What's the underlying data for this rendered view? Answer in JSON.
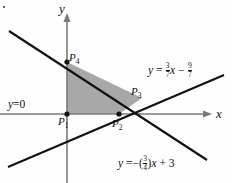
{
  "figure": {
    "type": "coordinate-plane-diagram",
    "width": 232,
    "height": 183,
    "colors": {
      "shade_fill": "#a8a8a8",
      "line": "#111111",
      "axis": "#7a7a7a",
      "background": "#fefefe",
      "text": "#111111"
    }
  },
  "axes": {
    "x_label": "x",
    "y_label": "y",
    "origin_px": [
      67,
      114
    ],
    "x_axis_y_px": 114,
    "y_axis_x_px": 67
  },
  "lines": [
    {
      "name": "x-axis-constraint",
      "label": "y = 0",
      "label_lhs": "y",
      "label_op": "=",
      "label_rhs": "0",
      "slope": 0,
      "intercept": 0
    },
    {
      "name": "descending-line",
      "label": "y = -(3/4)x + 3",
      "lhs": "y",
      "eq": "=",
      "sign": "−(",
      "frac_num": "3",
      "frac_den": "4",
      "close_paren": ")",
      "var": "x",
      "plus": "+",
      "constant": "3",
      "slope": -0.75,
      "intercept": 3
    },
    {
      "name": "ascending-line",
      "label": "y = (3/7)x - 9/7",
      "lhs": "y",
      "eq": "=",
      "frac1_num": "3",
      "frac1_den": "7",
      "var": "x",
      "minus": "−",
      "frac2_num": "9",
      "frac2_den": "7",
      "slope": 0.4286,
      "intercept": -1.2857
    }
  ],
  "points": [
    {
      "id": "P1",
      "letter": "P",
      "sub": "1",
      "role": "origin-vertex",
      "px": [
        67,
        114
      ]
    },
    {
      "id": "P2",
      "letter": "P",
      "sub": "2",
      "role": "x-axis-vertex",
      "px": [
        119,
        114
      ]
    },
    {
      "id": "P3",
      "letter": "P",
      "sub": "3",
      "role": "lines-intersection-vertex",
      "px": [
        142,
        98
      ]
    },
    {
      "id": "P4",
      "letter": "P",
      "sub": "4",
      "role": "y-axis-vertex",
      "px": [
        67,
        62
      ]
    }
  ],
  "shaded_region": {
    "name": "feasible-region",
    "vertices": [
      "P1",
      "P2",
      "P3",
      "P4"
    ],
    "polygon_px": "67,114 119,114 142,98 67,62"
  }
}
